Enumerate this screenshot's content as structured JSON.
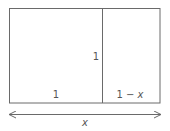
{
  "diagram": {
    "type": "golden-rectangle-division",
    "labels": {
      "left_width": "1",
      "divider_height": "1",
      "right_width_prefix": "1 − ",
      "right_width_var": "x",
      "total_width": "x"
    },
    "colors": {
      "stroke": "#6a6a6a",
      "text": "#555555",
      "background": "#ffffff"
    }
  }
}
